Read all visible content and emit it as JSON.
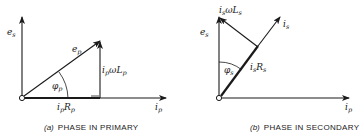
{
  "panel_a": {
    "caption_tag": "(a)",
    "caption_text": "PHASE IN PRIMARY",
    "labels": {
      "vertical_axis_main": "e",
      "vertical_axis_sub": "s",
      "horizontal_axis_main": "i",
      "horizontal_axis_sub": "p",
      "hypotenuse_main": "e",
      "hypotenuse_sub": "p",
      "vertical_leg_main": "i",
      "vertical_leg_mid": "p",
      "vertical_leg_omega": "ωL",
      "vertical_leg_sub": "p",
      "horizontal_leg_main": "i",
      "horizontal_leg_mid": "p",
      "horizontal_leg_R": "R",
      "horizontal_leg_sub": "p",
      "angle_main": "φ",
      "angle_sub": "p"
    }
  },
  "panel_b": {
    "caption_tag": "(b)",
    "caption_text": "PHASE IN SECONDARY",
    "labels": {
      "vertical_axis_main": "e",
      "vertical_axis_sub": "s",
      "horizontal_axis_main": "i",
      "horizontal_axis_sub": "p",
      "current_main": "i",
      "current_sub": "s",
      "reactive_main": "i",
      "reactive_mid": "s",
      "reactive_omega": "ωL",
      "reactive_sub": "s",
      "resistive_main": "i",
      "resistive_mid": "s",
      "resistive_R": "R",
      "resistive_sub": "s",
      "angle_main": "φ",
      "angle_sub": "s"
    }
  }
}
